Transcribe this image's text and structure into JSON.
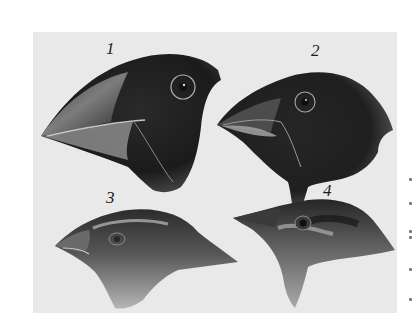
{
  "figure": {
    "background_color": "#e9e9e9",
    "page_color": "#ffffff",
    "ink_color": "#1e1e1e",
    "birds": [
      {
        "label": "1",
        "beak": "large, deep crushing beak",
        "plumage": "dark"
      },
      {
        "label": "2",
        "beak": "medium thick beak",
        "plumage": "dark"
      },
      {
        "label": "3",
        "beak": "small short beak",
        "plumage": "light/medium"
      },
      {
        "label": "4",
        "beak": "thin pointed beak",
        "plumage": "light/medium"
      }
    ]
  }
}
